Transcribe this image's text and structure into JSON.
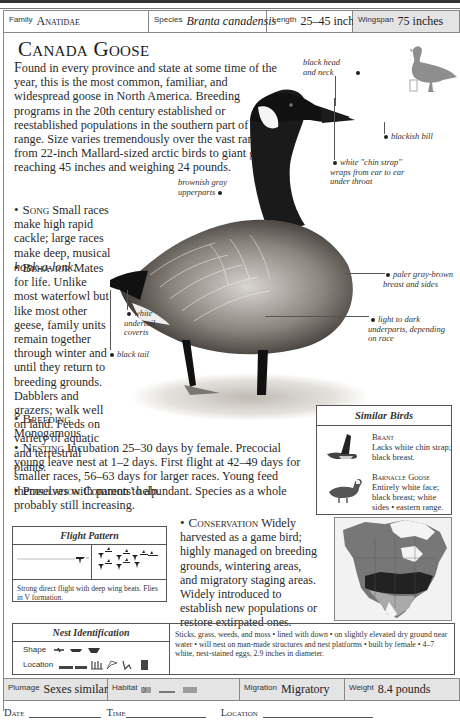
{
  "header": {
    "family_label": "Family",
    "family_value": "Anatidae",
    "species_label": "Species",
    "species_value": "Branta canadensis",
    "length_label": "Length",
    "length_value": "25–45 inches",
    "wingspan_label": "Wingspan",
    "wingspan_value": "75 inches"
  },
  "title": "Canada Goose",
  "intro": {
    "first_letter": "F",
    "text": "ound in every province and state at some time of the year, this is the most common, familiar, and widespread goose in North America. Breeding programs in the 20th century established or reestablished populations in the southern part of the range. Size varies tremendously over the vast range, from 22-inch Mallard-sized arctic birds to giant geese reaching 45 inches and weighing 24 pounds."
  },
  "sections": {
    "song": {
      "heading": "Song",
      "text": "Small races make high rapid cackle; large races make deep, musical",
      "italic": "honk-a-lonk."
    },
    "behavior": {
      "heading": "Behavior",
      "text": "Mates for life. Unlike most waterfowl but like most other geese, family units remain together through winter and until they return to breeding grounds. Dabblers and grazers; walk well on land. Feeds on variety of aquatic and terrestrial plants."
    },
    "breeding": {
      "heading": "Breeding",
      "text": "Monogamous."
    },
    "nesting": {
      "heading": "Nesting",
      "text": "Incubation 25–30 days by female. Precocial young leave nest at 1–2 days. First flight at 42–49 days for smaller races, 56–63 days for larger races. Young feed themselves with parents' help."
    },
    "population": {
      "heading": "Population",
      "text": "Common to abundant. Species as a whole probably still increasing."
    },
    "conservation": {
      "heading": "Conservation",
      "text": "Widely harvested as a game bird; highly managed on breeding grounds, wintering areas, and migratory staging areas. Widely introduced to establish new populations or restore extirpated ones."
    }
  },
  "annotations": {
    "head": "black head and neck",
    "bill": "blackish bill",
    "chin": "white \"chin strap\" wraps from ear to ear under throat",
    "upperparts": "brownish gray upperparts",
    "breast": "paler gray-brown breast and sides",
    "underparts": "light to dark underparts, depending on race",
    "undertail": "white undertail coverts",
    "tail": "black tail"
  },
  "similar_birds": {
    "title": "Similar Birds",
    "items": [
      {
        "name": "Brant",
        "desc": "Lacks white chin strap; black breast."
      },
      {
        "name": "Barnacle Goose",
        "desc": "Entirely white face; black breast; white sides • eastern range."
      }
    ]
  },
  "flight_pattern": {
    "title": "Flight Pattern",
    "desc": "Strong direct flight with deep wing beats. Flies in V formation."
  },
  "nest": {
    "title": "Nest Identification",
    "shape_label": "Shape",
    "location_label": "Location",
    "desc": "Sticks, grass, weeds, and moss • lined with down • on slightly elevated dry ground near water • will nest on man-made structures and nest platforms • built by female • 4–7 white, nest-stained eggs, 2.9 inches in diameter."
  },
  "footer": {
    "plumage_label": "Plumage",
    "plumage_value": "Sexes similar",
    "habitat_label": "Habitat",
    "migration_label": "Migration",
    "migration_value": "Migratory",
    "weight_label": "Weight",
    "weight_value": "8.4 pounds"
  },
  "log": {
    "date": "Date",
    "time": "Time",
    "location": "Location"
  },
  "colors": {
    "header_shade": "#e4e4e4",
    "border": "#888888",
    "text": "#222222"
  }
}
